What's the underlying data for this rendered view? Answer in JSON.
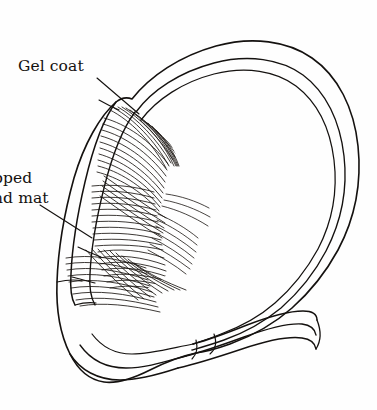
{
  "figure": {
    "background_color": "#fefefe",
    "ink_color": "#14110f",
    "width": 377,
    "height": 410
  },
  "labels": {
    "gel_coat": {
      "text": "Gel coat",
      "name": "gel-coat-label"
    },
    "strand_mat": {
      "line1": "pped",
      "line2": "nd mat",
      "full_text": "Chopped strand mat",
      "clipped": "true",
      "name": "chopped-strand-mat-label"
    }
  },
  "leaders": {
    "gel_coat_leader": "leader-line-gel-coat",
    "strand_mat_leader": "leader-line-strand-mat"
  },
  "layers": [
    {
      "name": "gel-coat-layer",
      "description": "Thin outer resin skin drawn as narrow band along outline"
    },
    {
      "name": "chopped-strand-mat-layer",
      "description": "Hatched fibrous reinforcement layer on inner face"
    },
    {
      "name": "laminate-shell-outline",
      "description": "Closed teardrop shell contour with tapering tail"
    }
  ]
}
